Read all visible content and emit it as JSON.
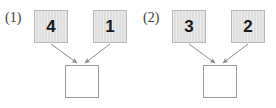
{
  "figure": {
    "background_color": "#ffffff",
    "node_fill_color": "#dedede",
    "node_border_color": "#b9b9b9",
    "empty_node_fill_color": "#ffffff",
    "empty_node_border_color": "#9a9a9a",
    "arrow_color": "#8c8c8c",
    "text_color": "#1a1a1a"
  },
  "panels": [
    {
      "label": "(1)",
      "inputs": [
        {
          "value": "4"
        },
        {
          "value": "1"
        }
      ],
      "output": {
        "value": ""
      }
    },
    {
      "label": "(2)",
      "inputs": [
        {
          "value": "3"
        },
        {
          "value": "2"
        }
      ],
      "output": {
        "value": ""
      }
    }
  ]
}
